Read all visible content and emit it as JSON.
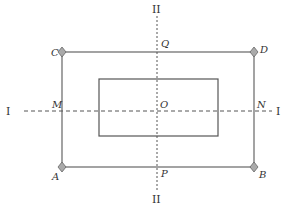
{
  "diagram": {
    "axes": {
      "horizontal_label": "I",
      "vertical_label": "II"
    },
    "points": {
      "A": "A",
      "B": "B",
      "C": "C",
      "D": "D",
      "M": "M",
      "N": "N",
      "P": "P",
      "Q": "Q",
      "O": "O"
    },
    "colors": {
      "line": "#555555",
      "vertex": "#999999"
    }
  }
}
